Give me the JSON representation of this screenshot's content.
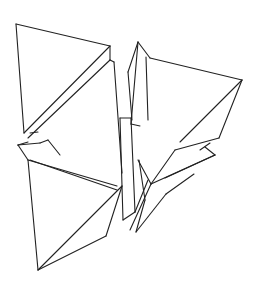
{
  "figure": {
    "width": 260,
    "height": 285,
    "background": "#ffffff",
    "stroke_color": "#222222",
    "segments": [
      [
        16,
        24,
        110,
        46
      ],
      [
        16,
        24,
        24,
        133
      ],
      [
        24,
        133,
        110,
        46
      ],
      [
        110,
        46,
        110,
        60
      ],
      [
        110,
        60,
        28,
        138
      ],
      [
        30,
        133,
        38,
        132
      ],
      [
        110,
        60,
        114,
        62
      ],
      [
        114,
        62,
        122,
        173
      ],
      [
        138,
        42,
        150,
        58
      ],
      [
        138,
        42,
        131,
        124
      ],
      [
        131,
        124,
        140,
        126
      ],
      [
        146,
        57,
        148,
        120
      ],
      [
        150,
        58,
        242,
        80
      ],
      [
        242,
        80,
        180,
        142
      ],
      [
        242,
        80,
        219,
        138
      ],
      [
        219,
        138,
        175,
        150
      ],
      [
        138,
        42,
        128,
        72
      ],
      [
        128,
        72,
        132,
        120
      ],
      [
        28,
        142,
        18,
        145
      ],
      [
        18,
        145,
        28,
        160
      ],
      [
        28,
        160,
        117,
        186
      ],
      [
        18,
        145,
        40,
        143
      ],
      [
        40,
        143,
        48,
        140
      ],
      [
        48,
        140,
        60,
        155
      ],
      [
        28,
        160,
        38,
        270
      ],
      [
        38,
        270,
        122,
        186
      ],
      [
        38,
        270,
        106,
        236
      ],
      [
        106,
        236,
        122,
        186
      ],
      [
        30,
        160,
        117,
        190
      ],
      [
        120,
        118,
        131,
        118
      ],
      [
        120,
        118,
        123,
        220
      ],
      [
        123,
        220,
        135,
        212
      ],
      [
        131,
        118,
        135,
        212
      ],
      [
        135,
        212,
        148,
        180
      ],
      [
        138,
        160,
        151,
        184
      ],
      [
        151,
        184,
        215,
        155
      ],
      [
        139,
        160,
        145,
        200
      ],
      [
        145,
        200,
        136,
        232
      ],
      [
        136,
        232,
        166,
        194
      ],
      [
        151,
        184,
        130,
        230
      ],
      [
        166,
        194,
        194,
        174
      ],
      [
        215,
        155,
        165,
        178
      ],
      [
        205,
        147,
        215,
        155
      ],
      [
        200,
        150,
        210,
        143
      ],
      [
        151,
        184,
        175,
        150
      ]
    ]
  }
}
